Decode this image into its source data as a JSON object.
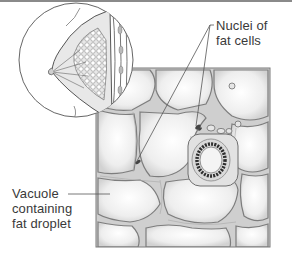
{
  "diagram": {
    "inset": "Cross-section of breast showing glandular and fatty tissue",
    "main": "Magnified adipose (fat) tissue with a small blood vessel",
    "labels": {
      "nuclei": {
        "line1": "Nuclei of",
        "line2": "fat cells"
      },
      "vacuole": {
        "line1": "Vacuole",
        "line2": "containing",
        "line3": "fat droplet"
      }
    },
    "colors": {
      "line": "#555555",
      "cell_wall": "#8c8c8c",
      "cell_fill": "#f0f0f0",
      "text": "#3a3a3a",
      "border": "#8a8a8a"
    }
  }
}
